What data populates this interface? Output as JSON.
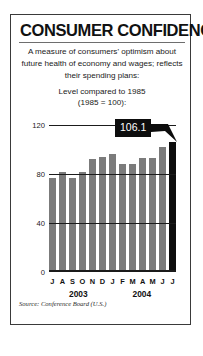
{
  "panel": {
    "title": "CONSUMER CONFIDENCE",
    "description": "A measure of consumers' optimism about future health of economy and wages; reflects their spending plans:",
    "subtitle_line1": "Level compared to 1985",
    "subtitle_line2": "(1985 = 100):",
    "source": "Source: Conference Board (U.S.)"
  },
  "callout": {
    "value": "106.1"
  },
  "chart_data": {
    "type": "bar",
    "title": "Consumer Confidence",
    "subtitle": "Level compared to 1985 (1985 = 100):",
    "xlabel": "",
    "ylabel": "",
    "ylim": [
      0,
      120
    ],
    "yticks": [
      "0",
      "40",
      "80",
      "120"
    ],
    "ytick_values": [
      0,
      40,
      80,
      120
    ],
    "grid": true,
    "legend": false,
    "categories": [
      "J",
      "A",
      "S",
      "O",
      "N",
      "D",
      "J",
      "F",
      "M",
      "A",
      "M",
      "J",
      "J"
    ],
    "values": [
      77,
      82,
      77,
      82,
      92,
      94,
      96,
      88,
      88,
      93,
      93,
      102,
      106.1
    ],
    "highlight_index": 12,
    "annotations": [
      {
        "label": "106.1",
        "index": 12,
        "value": 106.1
      }
    ],
    "group_labels": [
      {
        "label": "2003",
        "start_index": 0,
        "end_index": 5
      },
      {
        "label": "2004",
        "start_index": 6,
        "end_index": 12
      }
    ],
    "colors": {
      "bar": "#7b7b7b",
      "bar_highlight": "#0d0d0d",
      "axis": "#1b1b1b",
      "callout_bg": "#0d0d0d",
      "callout_text": "#ffffff",
      "border": "#3a3a3a",
      "background": "#ffffff"
    },
    "source": "Source: Conference Board (U.S.)"
  }
}
